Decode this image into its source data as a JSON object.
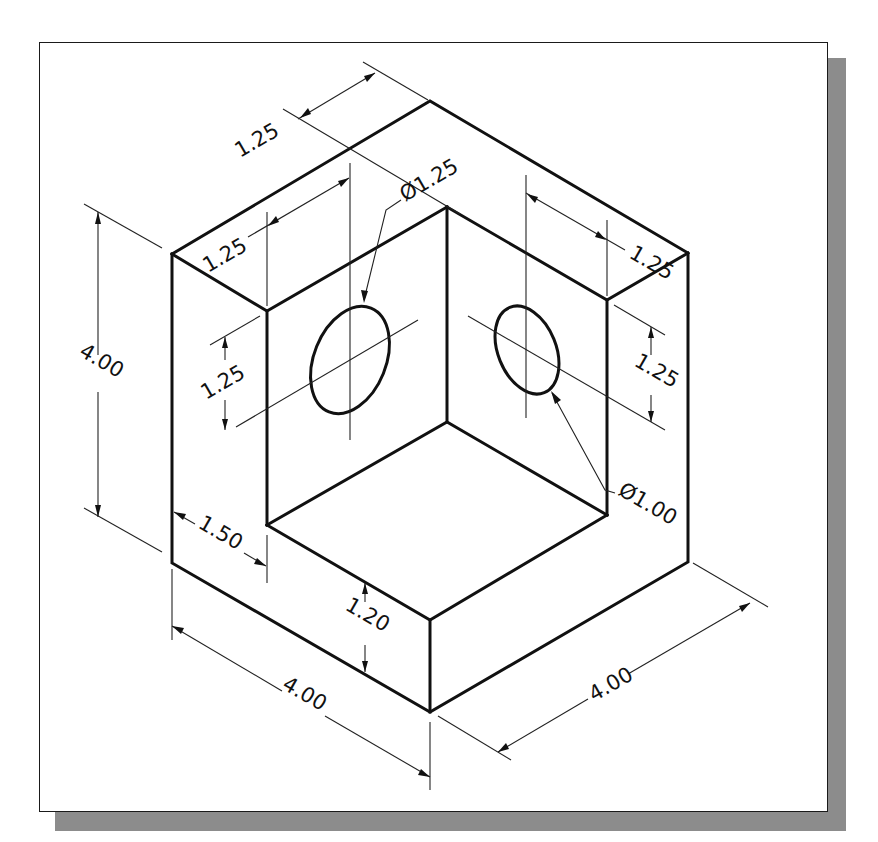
{
  "figure": {
    "type": "isometric technical drawing",
    "line_color": "#111111",
    "frame_color": "#1a1a1a",
    "shadow_color": "#8c8c8c",
    "background": "#ffffff"
  },
  "dimensions": {
    "top_depth": "1.25",
    "left_wall_thickness": "1.25",
    "right_wall_thickness": "1.25",
    "left_hole_diameter": "Ø1.25",
    "right_hole_diameter": "Ø1.00",
    "overall_height": "4.00",
    "left_hole_height": "1.25",
    "right_hole_height": "1.25",
    "base_offset": "1.50",
    "base_height": "1.20",
    "overall_width_left": "4.00",
    "overall_width_right": "4.00"
  }
}
